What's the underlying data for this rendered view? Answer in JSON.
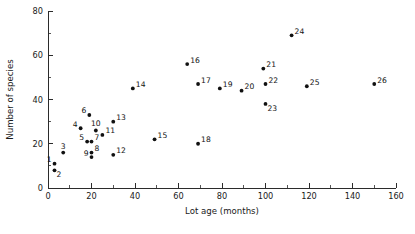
{
  "chart_data": {
    "type": "scatter",
    "title": "",
    "xlabel": "Lot age (months)",
    "ylabel": "Number of species",
    "xlim": [
      0,
      160
    ],
    "ylim": [
      0,
      80
    ],
    "xticks": [
      0,
      20,
      40,
      60,
      80,
      100,
      120,
      140,
      160
    ],
    "yticks": [
      0,
      20,
      40,
      60,
      80
    ],
    "x_minor_step": 10,
    "y_minor_step": 10,
    "grid": false,
    "legend": null,
    "marker_color": "#111111",
    "axis_color": "#2b2b2b",
    "background": "#ffffff",
    "points": [
      {
        "label": "1",
        "x": 3,
        "y": 11,
        "label_pos": "left"
      },
      {
        "label": "2",
        "x": 3,
        "y": 8,
        "label_pos": "below"
      },
      {
        "label": "3",
        "x": 7,
        "y": 16,
        "label_pos": "above"
      },
      {
        "label": "4",
        "x": 15,
        "y": 27,
        "label_pos": "left"
      },
      {
        "label": "5",
        "x": 18,
        "y": 21,
        "label_pos": "left"
      },
      {
        "label": "6",
        "x": 19,
        "y": 33,
        "label_pos": "left"
      },
      {
        "label": "7",
        "x": 20,
        "y": 21,
        "label_pos": "right"
      },
      {
        "label": "8",
        "x": 20,
        "y": 16,
        "label_pos": "right"
      },
      {
        "label": "9",
        "x": 20,
        "y": 14,
        "label_pos": "left"
      },
      {
        "label": "10",
        "x": 22,
        "y": 26,
        "label_pos": "above"
      },
      {
        "label": "11",
        "x": 25,
        "y": 24,
        "label_pos": "right"
      },
      {
        "label": "12",
        "x": 30,
        "y": 15,
        "label_pos": "right"
      },
      {
        "label": "13",
        "x": 30,
        "y": 30,
        "label_pos": "right"
      },
      {
        "label": "14",
        "x": 39,
        "y": 45,
        "label_pos": "right"
      },
      {
        "label": "15",
        "x": 49,
        "y": 22,
        "label_pos": "right"
      },
      {
        "label": "16",
        "x": 64,
        "y": 56,
        "label_pos": "right"
      },
      {
        "label": "17",
        "x": 69,
        "y": 47,
        "label_pos": "right"
      },
      {
        "label": "18",
        "x": 69,
        "y": 20,
        "label_pos": "right"
      },
      {
        "label": "19",
        "x": 79,
        "y": 45,
        "label_pos": "right"
      },
      {
        "label": "20",
        "x": 89,
        "y": 44,
        "label_pos": "right"
      },
      {
        "label": "21",
        "x": 99,
        "y": 54,
        "label_pos": "right"
      },
      {
        "label": "22",
        "x": 100,
        "y": 47,
        "label_pos": "right"
      },
      {
        "label": "23",
        "x": 100,
        "y": 38,
        "label_pos": "below"
      },
      {
        "label": "24",
        "x": 112,
        "y": 69,
        "label_pos": "right"
      },
      {
        "label": "25",
        "x": 119,
        "y": 46,
        "label_pos": "right"
      },
      {
        "label": "26",
        "x": 150,
        "y": 47,
        "label_pos": "right"
      }
    ]
  }
}
